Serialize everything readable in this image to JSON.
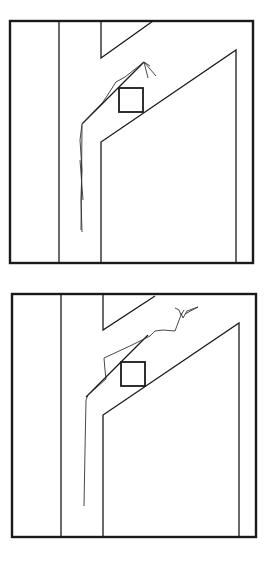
{
  "figure": {
    "panels": [
      {
        "id": "top",
        "frame": {
          "x": 10,
          "y": 21,
          "w": 243,
          "h": 242
        },
        "walls": [
          "M59,21 L59,263",
          "M101,21 L101,58 L153,21",
          "M101,263 L101,142 L236,50 L236,263",
          "M82,124 L144,62"
        ],
        "target_box": {
          "x": 119,
          "y": 88,
          "w": 24,
          "h": 24
        },
        "trajectory": "M82,232 L81,200 L82,170 L80,140 L82,124 L103,102 L116,82 L125,77 L144,62 L148,78 M144,62 L156,76 M144,62 L150,66",
        "trajectory_extra": "M81,230 L82,125 M80,160 L83,200"
      },
      {
        "id": "bottom",
        "frame": {
          "x": 12,
          "y": 294,
          "w": 244,
          "h": 243
        },
        "walls": [
          "M61,294 L61,537",
          "M103,294 L103,330 L155,296",
          "M103,537 L103,415 L239,323 L239,537",
          "M86,397 L148,335"
        ],
        "target_box": {
          "x": 121,
          "y": 362,
          "w": 24,
          "h": 24
        },
        "trajectory": "M84,506 L85,450 L86,400 L88,395 L106,379 L105,370 L104,358 L132,345 L150,336 L155,331 L163,330 L175,331 L181,315 L179,310 L175,308 M181,313 L183,318 L187,311 L198,307 L185,314 M181,315 L184,310",
        "trajectory_extra": ""
      }
    ]
  }
}
